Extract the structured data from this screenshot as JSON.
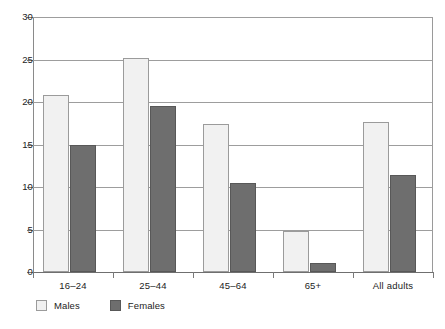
{
  "chart_data": {
    "type": "bar",
    "title": "",
    "subtitle": "",
    "xlabel": "",
    "ylabel": "",
    "categories": [
      "16–24",
      "25–44",
      "45–64",
      "65+",
      "All adults"
    ],
    "series": [
      {
        "name": "Males",
        "color": "#f1f1f1",
        "values": [
          20.8,
          25.2,
          17.4,
          4.8,
          17.7
        ]
      },
      {
        "name": "Females",
        "color": "#6e6e6e",
        "values": [
          15.0,
          19.5,
          10.5,
          1.1,
          11.4
        ]
      }
    ],
    "ylim": [
      0,
      30
    ],
    "yticks": [
      0,
      5,
      10,
      15,
      20,
      25,
      30
    ],
    "ytick_labels": [
      "0",
      "5",
      "10",
      "15",
      "20",
      "25",
      "30"
    ],
    "grid": true,
    "legend_position": "bottom-left",
    "legend": [
      "Males",
      "Females"
    ]
  }
}
